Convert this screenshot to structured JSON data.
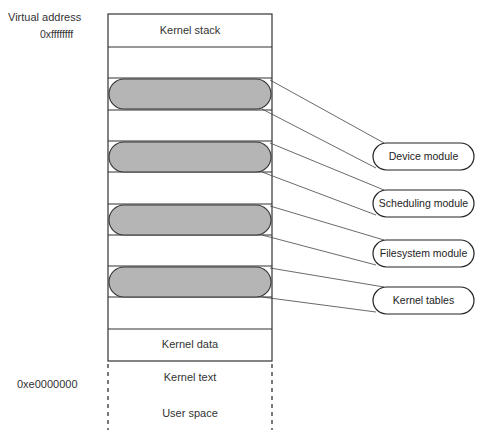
{
  "diagram": {
    "address_labels": {
      "header": "Virtual address",
      "top": "0xffffffff",
      "bottom": "0xe0000000"
    },
    "memory_regions": [
      {
        "label": "Kernel stack",
        "type": "plain"
      },
      {
        "label": "",
        "type": "plain"
      },
      {
        "label": "",
        "type": "module-slot"
      },
      {
        "label": "",
        "type": "plain"
      },
      {
        "label": "",
        "type": "module-slot"
      },
      {
        "label": "",
        "type": "plain"
      },
      {
        "label": "",
        "type": "module-slot"
      },
      {
        "label": "",
        "type": "plain"
      },
      {
        "label": "",
        "type": "module-slot"
      },
      {
        "label": "",
        "type": "plain"
      },
      {
        "label": "Kernel data",
        "type": "plain"
      },
      {
        "label": "Kernel text",
        "type": "plain"
      },
      {
        "label": "User space",
        "type": "dashed"
      }
    ],
    "modules": [
      {
        "label": "Device module"
      },
      {
        "label": "Scheduling module"
      },
      {
        "label": "Filesystem module"
      },
      {
        "label": "Kernel tables"
      }
    ],
    "colors": {
      "stroke": "#333333",
      "module_fill": "#b5b5b5",
      "background": "#ffffff"
    }
  }
}
